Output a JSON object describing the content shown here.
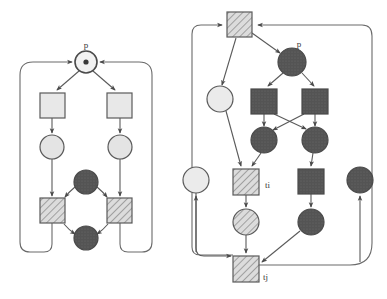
{
  "figure": {
    "background_color": "#ffffff",
    "stroke_color": "#5a5a5a",
    "label_color": "#3a3a3a"
  },
  "palette": {
    "light_fill": "#e8e8e8",
    "light_circle_fill": "#e4e4e4",
    "dark_fill": "#545454",
    "dark_circle_fill": "#4f4f4f",
    "hatch_fill": "#dcdcdc",
    "hatch_line": "#6a6a6a",
    "outline": "#5a5a5a",
    "arrow": "#4a4a4a"
  },
  "diagrams": [
    {
      "id": "left-net",
      "name": "left-petri-net",
      "labels": [
        {
          "id": "label-p-left",
          "text": "p",
          "x": 86,
          "y": 48
        }
      ],
      "places": [
        {
          "id": "L-p",
          "name": "place-p-marked",
          "shape": "circle-token",
          "style": "light",
          "cx": 86,
          "cy": 62,
          "r": 11,
          "token": true
        },
        {
          "id": "L-c1",
          "name": "place-light-left",
          "shape": "circle",
          "style": "light",
          "cx": 52,
          "cy": 147,
          "r": 12
        },
        {
          "id": "L-c2",
          "name": "place-light-right",
          "shape": "circle",
          "style": "light",
          "cx": 120,
          "cy": 147,
          "r": 12
        },
        {
          "id": "L-d1",
          "name": "place-dark-top",
          "shape": "circle",
          "style": "dark",
          "cx": 86,
          "cy": 182,
          "r": 12
        },
        {
          "id": "L-d2",
          "name": "place-dark-bottom",
          "shape": "circle",
          "style": "dark",
          "cx": 86,
          "cy": 238,
          "r": 12
        }
      ],
      "transitions": [
        {
          "id": "L-t1",
          "name": "transition-light-left",
          "shape": "square",
          "style": "light",
          "x": 40,
          "y": 93,
          "w": 25,
          "h": 25
        },
        {
          "id": "L-t2",
          "name": "transition-light-right",
          "shape": "square",
          "style": "light",
          "x": 107,
          "y": 93,
          "w": 25,
          "h": 25
        },
        {
          "id": "L-t3",
          "name": "transition-hatched-left",
          "shape": "square",
          "style": "hatched",
          "x": 40,
          "y": 198,
          "w": 25,
          "h": 25
        },
        {
          "id": "L-t4",
          "name": "transition-hatched-right",
          "shape": "square",
          "style": "hatched",
          "x": 107,
          "y": 198,
          "w": 25,
          "h": 25
        }
      ]
    },
    {
      "id": "right-net",
      "name": "right-petri-net",
      "labels": [
        {
          "id": "label-p-right",
          "text": "p",
          "x": 299,
          "y": 47
        },
        {
          "id": "label-ti",
          "text": "ti",
          "x": 262,
          "y": 188
        },
        {
          "id": "label-tj",
          "text": "tj",
          "x": 258,
          "y": 279
        }
      ],
      "places": [
        {
          "id": "R-p",
          "name": "place-p-dark",
          "shape": "circle",
          "style": "dark",
          "cx": 292,
          "cy": 62,
          "r": 14
        },
        {
          "id": "R-cl",
          "name": "place-light-upper-left",
          "shape": "circle",
          "style": "light",
          "cx": 220,
          "cy": 99,
          "r": 13
        },
        {
          "id": "R-cfl",
          "name": "place-light-far-left",
          "shape": "circle",
          "style": "light",
          "cx": 196,
          "cy": 180,
          "r": 13
        },
        {
          "id": "R-d1",
          "name": "place-dark-mid-left",
          "shape": "circle",
          "style": "dark",
          "cx": 264,
          "cy": 140,
          "r": 13
        },
        {
          "id": "R-d2",
          "name": "place-dark-mid-right",
          "shape": "circle",
          "style": "dark",
          "cx": 315,
          "cy": 140,
          "r": 13
        },
        {
          "id": "R-h",
          "name": "place-hatched-lower",
          "shape": "circle",
          "style": "hatched",
          "cx": 246,
          "cy": 222,
          "r": 13
        },
        {
          "id": "R-d3",
          "name": "place-dark-lower-right",
          "shape": "circle",
          "style": "dark",
          "cx": 311,
          "cy": 222,
          "r": 13
        },
        {
          "id": "R-dfr",
          "name": "place-dark-far-right",
          "shape": "circle",
          "style": "dark",
          "cx": 360,
          "cy": 180,
          "r": 13
        }
      ],
      "transitions": [
        {
          "id": "R-top",
          "name": "transition-hatched-top",
          "shape": "square",
          "style": "hatched",
          "x": 227,
          "y": 12,
          "w": 25,
          "h": 25
        },
        {
          "id": "R-s1",
          "name": "transition-dark-left",
          "shape": "square",
          "style": "dark",
          "x": 251,
          "y": 89,
          "w": 26,
          "h": 25
        },
        {
          "id": "R-s2",
          "name": "transition-dark-right",
          "shape": "square",
          "style": "dark",
          "x": 302,
          "y": 89,
          "w": 26,
          "h": 25
        },
        {
          "id": "R-ti",
          "name": "transition-ti",
          "shape": "square",
          "style": "hatched",
          "x": 233,
          "y": 169,
          "w": 26,
          "h": 26
        },
        {
          "id": "R-s3",
          "name": "transition-dark-lower-right",
          "shape": "square",
          "style": "dark",
          "x": 298,
          "y": 169,
          "w": 26,
          "h": 25
        },
        {
          "id": "R-tj",
          "name": "transition-tj",
          "shape": "square",
          "style": "hatched",
          "x": 233,
          "y": 256,
          "w": 26,
          "h": 26
        }
      ]
    }
  ]
}
